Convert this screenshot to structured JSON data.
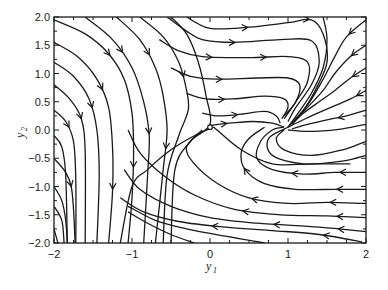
{
  "chart_data": {
    "type": "streamplot",
    "title": "",
    "xlabel": "y1",
    "ylabel": "y2",
    "xlim": [
      -2,
      2
    ],
    "ylim": [
      -2,
      2
    ],
    "grid": false,
    "legend": null,
    "x_ticks": [
      -2,
      -1,
      0,
      1,
      2
    ],
    "x_tick_labels": [
      "−2",
      "−1",
      "0",
      "1",
      "2"
    ],
    "y_ticks": [
      -2.0,
      -1.5,
      -1.0,
      -0.5,
      0.0,
      0.5,
      1.0,
      1.5,
      2.0
    ],
    "y_tick_labels": [
      "−2.0",
      "−1.5",
      "−1.0",
      "−0.5",
      "0.0",
      "0.5",
      "1.0",
      "1.5",
      "2.0"
    ],
    "minor_x_step": 0.25,
    "minor_y_step": 0.25,
    "line_color": "#1a1a1a",
    "annotations": [
      {
        "type": "circle-marker",
        "x": 0.0,
        "y": 0.05,
        "label": "saddle equilibrium"
      }
    ],
    "features": {
      "saddle_point": [
        0.0,
        0.05
      ],
      "focus_point": [
        1.0,
        0.0
      ]
    },
    "streamlines": [
      {
        "pts": [
          [
            -2,
            1.95
          ],
          [
            -1.6,
            1.7
          ],
          [
            -1.3,
            1.35
          ],
          [
            -1.1,
            0.9
          ],
          [
            -1.0,
            0.3
          ],
          [
            -0.98,
            -0.4
          ],
          [
            -1.0,
            -1.2
          ],
          [
            -1.05,
            -2
          ]
        ],
        "arrows": [
          0.25,
          0.7
        ]
      },
      {
        "pts": [
          [
            -2,
            1.55
          ],
          [
            -1.7,
            1.3
          ],
          [
            -1.45,
            0.9
          ],
          [
            -1.3,
            0.4
          ],
          [
            -1.25,
            -0.3
          ],
          [
            -1.25,
            -1.1
          ],
          [
            -1.3,
            -2
          ]
        ],
        "arrows": [
          0.3,
          0.75
        ]
      },
      {
        "pts": [
          [
            -2,
            1.2
          ],
          [
            -1.75,
            0.95
          ],
          [
            -1.55,
            0.55
          ],
          [
            -1.45,
            0.0
          ],
          [
            -1.42,
            -0.8
          ],
          [
            -1.45,
            -2
          ]
        ],
        "arrows": [
          0.3
        ]
      },
      {
        "pts": [
          [
            -2,
            0.8
          ],
          [
            -1.8,
            0.55
          ],
          [
            -1.65,
            0.2
          ],
          [
            -1.6,
            -0.4
          ],
          [
            -1.6,
            -2
          ]
        ],
        "arrows": [
          0.25
        ]
      },
      {
        "pts": [
          [
            -2,
            0.35
          ],
          [
            -1.85,
            0.15
          ],
          [
            -1.75,
            -0.2
          ],
          [
            -1.72,
            -0.9
          ],
          [
            -1.72,
            -2
          ]
        ],
        "arrows": [
          0.15
        ]
      },
      {
        "pts": [
          [
            -2,
            -0.1
          ],
          [
            -1.9,
            -0.3
          ],
          [
            -1.85,
            -0.8
          ],
          [
            -1.83,
            -2
          ]
        ],
        "arrows": []
      },
      {
        "pts": [
          [
            -2,
            -0.5
          ],
          [
            -1.85,
            -0.75
          ],
          [
            -1.78,
            -1.0
          ],
          [
            -1.75,
            -1.4
          ],
          [
            -1.73,
            -2
          ]
        ],
        "arrows": [
          0.35
        ]
      },
      {
        "pts": [
          [
            -2,
            -1.0
          ],
          [
            -1.9,
            -1.25
          ],
          [
            -1.85,
            -1.6
          ],
          [
            -1.83,
            -2
          ]
        ],
        "arrows": []
      },
      {
        "pts": [
          [
            -2,
            -1.35
          ],
          [
            -1.9,
            -1.6
          ],
          [
            -1.87,
            -2
          ]
        ],
        "arrows": []
      },
      {
        "pts": [
          [
            -2,
            -1.75
          ],
          [
            -1.95,
            -2
          ]
        ],
        "arrows": []
      },
      {
        "pts": [
          [
            -1.6,
            2
          ],
          [
            -1.25,
            1.6
          ],
          [
            -1.0,
            1.1
          ],
          [
            -0.85,
            0.5
          ],
          [
            -0.78,
            -0.1
          ],
          [
            -0.8,
            -0.8
          ],
          [
            -0.85,
            -2
          ]
        ],
        "arrows": [
          0.2,
          0.55
        ]
      },
      {
        "pts": [
          [
            -1.2,
            2
          ],
          [
            -0.9,
            1.6
          ],
          [
            -0.7,
            1.1
          ],
          [
            -0.6,
            0.6
          ],
          [
            -0.55,
            0.0
          ],
          [
            -0.6,
            -0.7
          ],
          [
            -0.7,
            -2
          ]
        ],
        "arrows": [
          0.2,
          0.6
        ]
      },
      {
        "pts": [
          [
            -0.9,
            2
          ],
          [
            -0.6,
            1.65
          ],
          [
            -0.4,
            1.2
          ],
          [
            -0.3,
            0.7
          ],
          [
            -0.28,
            0.35
          ],
          [
            -0.4,
            -0.1
          ],
          [
            -0.55,
            -0.8
          ],
          [
            -0.6,
            -2
          ]
        ],
        "arrows": [
          0.3
        ]
      },
      {
        "pts": [
          [
            -0.5,
            2
          ],
          [
            -0.3,
            1.7
          ],
          [
            -0.15,
            1.2
          ],
          [
            -0.05,
            0.6
          ],
          [
            0.0,
            0.1
          ],
          [
            -0.25,
            -0.2
          ],
          [
            -0.45,
            -0.7
          ],
          [
            -0.5,
            -2
          ]
        ],
        "arrows": []
      },
      {
        "pts": [
          [
            -0.3,
            2
          ],
          [
            0.0,
            1.8
          ],
          [
            0.5,
            1.82
          ],
          [
            1.0,
            1.9
          ],
          [
            1.3,
            1.95
          ],
          [
            1.45,
            1.7
          ],
          [
            1.5,
            1.2
          ],
          [
            1.35,
            0.7
          ],
          [
            1.2,
            0.35
          ],
          [
            1.05,
            0.1
          ]
        ],
        "arrows": [
          0.25,
          0.5
        ]
      },
      {
        "pts": [
          [
            -0.55,
            2
          ],
          [
            -0.3,
            1.75
          ],
          [
            -0.1,
            1.6
          ],
          [
            0.3,
            1.55
          ],
          [
            0.9,
            1.6
          ],
          [
            1.3,
            1.58
          ],
          [
            1.4,
            1.2
          ],
          [
            1.3,
            0.8
          ],
          [
            1.1,
            0.4
          ],
          [
            1.0,
            0.15
          ]
        ],
        "arrows": [
          0.3
        ]
      },
      {
        "pts": [
          [
            -0.65,
            1.6
          ],
          [
            -0.4,
            1.4
          ],
          [
            -0.1,
            1.3
          ],
          [
            0.5,
            1.28
          ],
          [
            1.0,
            1.3
          ],
          [
            1.25,
            1.2
          ],
          [
            1.25,
            0.85
          ],
          [
            1.1,
            0.5
          ],
          [
            0.95,
            0.2
          ]
        ],
        "arrows": [
          0.25,
          0.5
        ]
      },
      {
        "pts": [
          [
            -0.5,
            1.1
          ],
          [
            -0.25,
            0.95
          ],
          [
            0.1,
            0.9
          ],
          [
            0.6,
            0.92
          ],
          [
            1.0,
            0.92
          ],
          [
            1.15,
            0.8
          ],
          [
            1.1,
            0.5
          ],
          [
            0.95,
            0.25
          ]
        ],
        "arrows": [
          0.3
        ]
      },
      {
        "pts": [
          [
            -0.3,
            0.65
          ],
          [
            -0.05,
            0.55
          ],
          [
            0.3,
            0.55
          ],
          [
            0.7,
            0.6
          ],
          [
            0.95,
            0.55
          ],
          [
            1.0,
            0.4
          ],
          [
            0.92,
            0.2
          ]
        ],
        "arrows": [
          0.3
        ]
      },
      {
        "pts": [
          [
            -0.1,
            0.3
          ],
          [
            0.1,
            0.25
          ],
          [
            0.4,
            0.28
          ],
          [
            0.7,
            0.33
          ],
          [
            0.85,
            0.25
          ],
          [
            0.9,
            0.12
          ]
        ],
        "arrows": [
          0.4
        ]
      },
      {
        "pts": [
          [
            0.0,
            0.08
          ],
          [
            0.25,
            0.12
          ],
          [
            0.55,
            0.15
          ],
          [
            0.8,
            0.12
          ],
          [
            0.95,
            0.05
          ]
        ],
        "arrows": [
          0.2
        ]
      },
      {
        "pts": [
          [
            1.45,
            2
          ],
          [
            1.5,
            1.6
          ],
          [
            1.45,
            1.1
          ],
          [
            1.3,
            0.65
          ],
          [
            1.12,
            0.28
          ],
          [
            1.0,
            0.05
          ]
        ],
        "arrows": []
      },
      {
        "pts": [
          [
            2,
            1.95
          ],
          [
            1.75,
            1.65
          ],
          [
            1.6,
            1.3
          ],
          [
            1.45,
            0.9
          ],
          [
            1.28,
            0.5
          ],
          [
            1.1,
            0.2
          ],
          [
            1.0,
            0.05
          ]
        ],
        "arrows": [
          0.15
        ]
      },
      {
        "pts": [
          [
            2,
            1.5
          ],
          [
            1.8,
            1.3
          ],
          [
            1.6,
            1.0
          ],
          [
            1.45,
            0.7
          ],
          [
            1.25,
            0.4
          ],
          [
            1.08,
            0.15
          ]
        ],
        "arrows": [
          0.15
        ]
      },
      {
        "pts": [
          [
            2,
            1.1
          ],
          [
            1.8,
            0.92
          ],
          [
            1.6,
            0.7
          ],
          [
            1.4,
            0.5
          ],
          [
            1.2,
            0.3
          ],
          [
            1.05,
            0.1
          ]
        ],
        "arrows": [
          0.15
        ]
      },
      {
        "pts": [
          [
            2,
            0.7
          ],
          [
            1.8,
            0.55
          ],
          [
            1.55,
            0.4
          ],
          [
            1.35,
            0.28
          ],
          [
            1.15,
            0.15
          ],
          [
            1.0,
            0.05
          ]
        ],
        "arrows": [
          0.1
        ]
      },
      {
        "pts": [
          [
            2,
            0.35
          ],
          [
            1.75,
            0.25
          ],
          [
            1.5,
            0.18
          ],
          [
            1.25,
            0.1
          ],
          [
            1.05,
            0.02
          ]
        ],
        "arrows": [
          0.35
        ]
      },
      {
        "pts": [
          [
            2,
            0.1
          ],
          [
            1.7,
            0.02
          ],
          [
            1.4,
            -0.02
          ],
          [
            1.15,
            -0.02
          ],
          [
            1.0,
            0.0
          ]
        ],
        "arrows": []
      },
      {
        "pts": [
          [
            0.95,
            0.0
          ],
          [
            0.85,
            -0.15
          ],
          [
            0.95,
            -0.35
          ],
          [
            1.3,
            -0.45
          ],
          [
            1.7,
            -0.35
          ],
          [
            2,
            -0.2
          ]
        ],
        "arrows": []
      },
      {
        "pts": [
          [
            1.0,
            0.05
          ],
          [
            0.75,
            -0.15
          ],
          [
            0.8,
            -0.45
          ],
          [
            1.2,
            -0.6
          ],
          [
            1.7,
            -0.55
          ],
          [
            2,
            -0.45
          ]
        ],
        "arrows": []
      },
      {
        "pts": [
          [
            2,
            -0.75
          ],
          [
            1.6,
            -0.75
          ],
          [
            1.2,
            -0.78
          ],
          [
            0.8,
            -0.7
          ],
          [
            0.6,
            -0.5
          ],
          [
            0.65,
            -0.2
          ],
          [
            0.8,
            0.0
          ],
          [
            0.95,
            0.05
          ]
        ],
        "arrows": [
          0.15,
          0.45
        ]
      },
      {
        "pts": [
          [
            2,
            -1.05
          ],
          [
            1.6,
            -1.05
          ],
          [
            1.1,
            -1.05
          ],
          [
            0.7,
            -0.95
          ],
          [
            0.45,
            -0.7
          ],
          [
            0.4,
            -0.4
          ],
          [
            0.5,
            -0.15
          ],
          [
            0.7,
            0.05
          ]
        ],
        "arrows": [
          0.15,
          0.7
        ]
      },
      {
        "pts": [
          [
            2,
            -1.3
          ],
          [
            1.5,
            -1.28
          ],
          [
            1.0,
            -1.3
          ],
          [
            0.5,
            -1.2
          ],
          [
            0.1,
            -0.95
          ],
          [
            -0.2,
            -0.6
          ],
          [
            -0.3,
            -0.3
          ],
          [
            -0.1,
            0.0
          ]
        ],
        "arrows": [
          0.15,
          0.5
        ]
      },
      {
        "pts": [
          [
            2,
            -1.55
          ],
          [
            1.5,
            -1.52
          ],
          [
            0.9,
            -1.5
          ],
          [
            0.3,
            -1.4
          ],
          [
            -0.2,
            -1.15
          ],
          [
            -0.6,
            -0.8
          ],
          [
            -0.9,
            -0.4
          ],
          [
            -1.05,
            0.0
          ]
        ],
        "arrows": [
          0.1,
          0.45
        ]
      },
      {
        "pts": [
          [
            2,
            -1.8
          ],
          [
            1.4,
            -1.72
          ],
          [
            0.6,
            -1.65
          ],
          [
            0.0,
            -1.55
          ],
          [
            -0.5,
            -1.35
          ],
          [
            -0.9,
            -1.05
          ],
          [
            -1.1,
            -0.7
          ]
        ],
        "arrows": [
          0.1,
          0.35
        ]
      },
      {
        "pts": [
          [
            1.95,
            -1.98
          ],
          [
            1.4,
            -1.85
          ],
          [
            0.8,
            -1.78
          ],
          [
            0.2,
            -1.72
          ],
          [
            -0.4,
            -1.62
          ],
          [
            -0.85,
            -1.45
          ],
          [
            -1.15,
            -1.2
          ]
        ],
        "arrows": [
          0.15,
          0.6
        ]
      },
      {
        "pts": [
          [
            0.7,
            -2
          ],
          [
            0.2,
            -1.88
          ],
          [
            -0.3,
            -1.75
          ],
          [
            -0.7,
            -1.6
          ],
          [
            -1.05,
            -1.35
          ]
        ],
        "arrows": []
      },
      {
        "pts": [
          [
            -0.2,
            -2
          ],
          [
            -0.5,
            -1.85
          ],
          [
            -0.8,
            -1.65
          ],
          [
            -1.05,
            -1.45
          ]
        ],
        "arrows": []
      },
      {
        "pts": [
          [
            0.05,
            0.05
          ],
          [
            -0.2,
            -0.1
          ],
          [
            -0.5,
            -0.35
          ],
          [
            -0.8,
            -0.7
          ],
          [
            -1.0,
            -1.0
          ],
          [
            -1.15,
            -2
          ]
        ],
        "arrows": []
      },
      {
        "pts": [
          [
            0.05,
            0.05
          ],
          [
            0.4,
            -0.35
          ],
          [
            0.8,
            -0.6
          ],
          [
            1.3,
            -0.6
          ],
          [
            1.8,
            -0.6
          ]
        ],
        "arrows": []
      }
    ]
  }
}
